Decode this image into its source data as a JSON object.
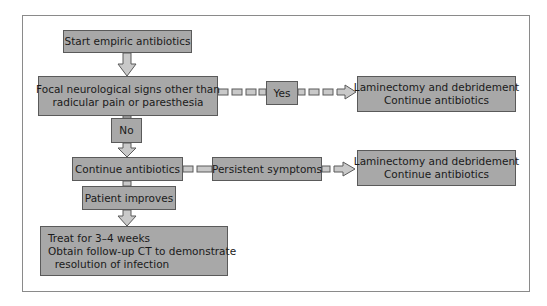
{
  "flowchart": {
    "nodes": {
      "start": {
        "lines": [
          "Start empiric antibiotics"
        ]
      },
      "focal": {
        "lines": [
          "Focal neurological signs other than",
          "radicular pain or paresthesia"
        ]
      },
      "yes": {
        "lines": [
          "Yes"
        ]
      },
      "no": {
        "lines": [
          "No"
        ]
      },
      "surgery1": {
        "lines": [
          "Laminectomy and debridement",
          "Continue antibiotics"
        ]
      },
      "continue": {
        "lines": [
          "Continue antibiotics"
        ]
      },
      "persistent": {
        "lines": [
          "Persistent symptoms"
        ]
      },
      "surgery2": {
        "lines": [
          "Laminectomy and debridement",
          "Continue antibiotics"
        ]
      },
      "improves": {
        "lines": [
          "Patient improves"
        ]
      },
      "treat": {
        "lines": [
          "Treat for 3–4 weeks",
          "Obtain follow-up CT to demonstrate",
          "  resolution of infection"
        ]
      }
    },
    "colors": {
      "box_fill": "#a8a8a8",
      "box_border": "#5a5a5a",
      "arrow_fill": "#c9c9c9",
      "frame": "#8a8a8a"
    }
  }
}
